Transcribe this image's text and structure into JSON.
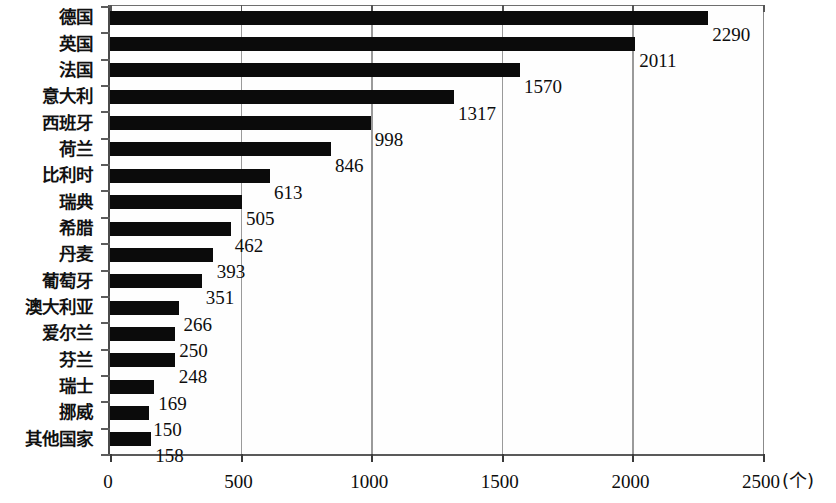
{
  "chart_data": {
    "type": "bar",
    "orientation": "horizontal",
    "title": "",
    "subtitle": "",
    "xlabel": "",
    "ylabel": "",
    "unit_label": "(个)",
    "xlim": [
      0,
      2500
    ],
    "xticks": [
      0,
      500,
      1000,
      1500,
      2000,
      2500
    ],
    "xtick_labels": [
      "0",
      "500",
      "1000",
      "1500",
      "2000",
      "2500"
    ],
    "grid": true,
    "grid_axis": "x",
    "legend": false,
    "legend_position": "none",
    "bar_color": "#0b0b0b",
    "categories": [
      "德国",
      "英国",
      "法国",
      "意大利",
      "西班牙",
      "荷兰",
      "比利时",
      "瑞典",
      "希腊",
      "丹麦",
      "葡萄牙",
      "澳大利亚",
      "爱尔兰",
      "芬兰",
      "瑞士",
      "挪威",
      "其他国家"
    ],
    "values": [
      2290,
      2011,
      1570,
      1317,
      998,
      846,
      613,
      505,
      462,
      393,
      351,
      266,
      250,
      248,
      169,
      150,
      158
    ],
    "value_labels": [
      "2290",
      "2011",
      "1570",
      "1317",
      "998",
      "846",
      "613",
      "505",
      "462",
      "393",
      "351",
      "266",
      "250",
      "248",
      "169",
      "150",
      "158"
    ]
  }
}
